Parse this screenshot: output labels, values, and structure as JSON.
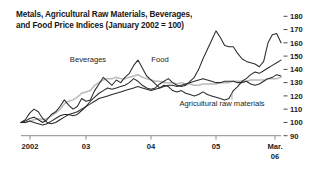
{
  "chart_data": {
    "type": "line",
    "title": "Metals, Agricultural Raw Materials, Beverages, and Food Price Indices (January 2002 = 100)",
    "title_line1": "Metals, Agricultural Raw Materials, Beverages,",
    "title_line2": "and Food Price Indices (January 2002 = 100)",
    "xlabel": "",
    "ylabel": "",
    "ylim": [
      90,
      180
    ],
    "y_ticks": [
      90,
      100,
      110,
      120,
      130,
      140,
      150,
      160,
      170,
      180
    ],
    "y_tick_labels": [
      "90",
      "100",
      "110",
      "120",
      "130",
      "140",
      "150",
      "160",
      "170",
      "180"
    ],
    "y_axis_position": "right",
    "x_ticks": [
      "2002",
      "03",
      "04",
      "05",
      "Mar. 06"
    ],
    "x_tick_labels": [
      "2002",
      "03",
      "04",
      "05",
      "Mar."
    ],
    "x_last_tick_second_line": "06",
    "grid": false,
    "legend_position": "inline-annotations",
    "x_range_start": "2002-01",
    "x_range_end": "2006-03",
    "annotations": [
      {
        "text": "Beverages",
        "x_px": 88,
        "y_px": 62,
        "series": "Beverages"
      },
      {
        "text": "Food",
        "x_px": 160,
        "y_px": 62,
        "series": "Food"
      },
      {
        "text": "Agricultural raw materials",
        "x_px": 222,
        "y_px": 106,
        "series": "Agricultural raw materials"
      }
    ],
    "series": [
      {
        "name": "Beverages",
        "color": "#2a2a2a",
        "style": "solid-dark",
        "values": [
          100,
          101,
          103,
          104,
          102,
          100,
          102,
          106,
          108,
          112,
          117,
          113,
          110,
          112,
          118,
          116,
          117,
          124,
          129,
          134,
          131,
          128,
          132,
          130,
          134,
          137,
          143,
          147,
          141,
          135,
          132,
          129,
          126,
          128,
          127,
          124,
          123,
          124,
          122,
          121,
          120,
          121,
          123,
          121,
          120,
          119,
          118,
          117,
          118,
          124,
          127,
          131,
          133,
          136,
          138,
          137,
          139,
          141,
          143,
          145,
          147
        ]
      },
      {
        "name": "Food",
        "color": "#b9b9b9",
        "style": "solid-gray",
        "values": [
          100,
          100,
          101,
          102,
          103,
          102,
          103,
          105,
          107,
          110,
          114,
          116,
          117,
          119,
          122,
          123,
          124,
          128,
          130,
          132,
          133,
          133,
          134,
          133,
          133,
          134,
          135,
          136,
          134,
          133,
          132,
          131,
          131,
          130,
          130,
          130,
          129,
          130,
          129,
          129,
          128,
          128,
          129,
          129,
          129,
          129,
          130,
          130,
          130,
          131,
          131,
          131,
          131,
          132,
          132,
          132,
          132,
          133,
          133,
          133,
          134
        ]
      },
      {
        "name": "Metals",
        "color": "#2a2a2a",
        "style": "solid-dark",
        "values": [
          100,
          102,
          107,
          110,
          108,
          103,
          100,
          99,
          100,
          102,
          104,
          106,
          105,
          106,
          109,
          112,
          116,
          119,
          122,
          124,
          126,
          125,
          126,
          127,
          128,
          130,
          133,
          131,
          128,
          126,
          125,
          126,
          129,
          131,
          133,
          130,
          128,
          127,
          128,
          131,
          134,
          140,
          148,
          155,
          162,
          169,
          164,
          158,
          157,
          157,
          152,
          148,
          146,
          145,
          144,
          142,
          146,
          160,
          166,
          167,
          160
        ]
      },
      {
        "name": "Agricultural raw materials",
        "color": "#2a2a2a",
        "style": "solid-dark",
        "values": [
          100,
          100,
          101,
          100,
          99,
          98,
          99,
          101,
          103,
          105,
          106,
          106,
          107,
          108,
          110,
          112,
          114,
          116,
          118,
          119,
          120,
          121,
          122,
          123,
          124,
          125,
          126,
          127,
          126,
          125,
          124,
          125,
          126,
          127,
          128,
          128,
          127,
          128,
          129,
          130,
          131,
          132,
          133,
          132,
          131,
          130,
          130,
          131,
          131,
          131,
          130,
          130,
          131,
          129,
          128,
          129,
          131,
          133,
          134,
          136,
          135
        ]
      }
    ]
  }
}
